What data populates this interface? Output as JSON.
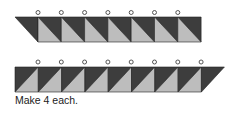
{
  "colors": {
    "dark": "#3d3d3d",
    "light": "#bdbdbd",
    "stroke": "#222222",
    "circle": "#444444"
  },
  "strips": [
    {
      "name": "top-strip",
      "units": 8,
      "circles": 7,
      "slant": "left"
    },
    {
      "name": "bottom-strip",
      "units": 8,
      "circles": 8,
      "slant": "right"
    }
  ],
  "caption": "Make 4 each."
}
